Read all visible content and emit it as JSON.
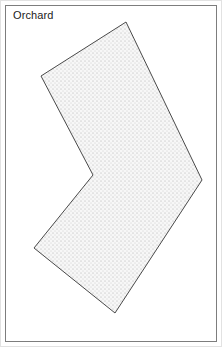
{
  "figure": {
    "label": "Orchard",
    "width": 222,
    "height": 347,
    "background_color": "#ffffff",
    "frame": {
      "outer_color": "#e2e2e2",
      "inner_color": "#7d7d7d",
      "inset_px": 5
    },
    "label_color": "#1b1b1b"
  },
  "chart_data": {
    "type": "map",
    "title": "Orchard",
    "xlabel": "",
    "ylabel": "",
    "xlim": [
      0,
      222
    ],
    "ylim": [
      0,
      347
    ],
    "grid": false,
    "legend": null,
    "shapes": [
      {
        "name": "orchard-parcel",
        "geometry": "polygon",
        "closed": true,
        "fill_pattern": "stipple-dots",
        "fill_color": "#f4f4f4",
        "dot_color": "#d8d8d8",
        "dot_spacing_px": 4,
        "stroke_color": "#4a4a4a",
        "stroke_width": 1,
        "vertices": [
          [
            126,
            22
          ],
          [
            202,
            180
          ],
          [
            115,
            313
          ],
          [
            34,
            248
          ],
          [
            93,
            175
          ],
          [
            41,
            76
          ]
        ]
      }
    ],
    "annotations": [
      {
        "text": "Orchard",
        "x": 13,
        "y": 9,
        "anchor": "top-left",
        "color": "#1b1b1b",
        "font_size": 11
      }
    ]
  }
}
